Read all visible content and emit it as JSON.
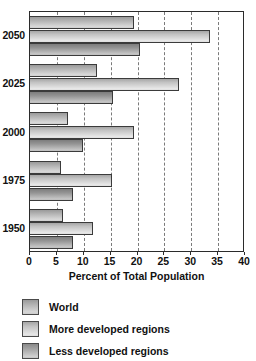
{
  "chart_data": {
    "type": "bar",
    "orientation": "horizontal",
    "title": "",
    "xlabel": "Percent of Total Population",
    "ylabel": "",
    "xlim": [
      0,
      40
    ],
    "xticks": [
      0,
      5,
      10,
      15,
      20,
      25,
      30,
      35,
      40
    ],
    "xtick_labels": [
      "0",
      "5",
      "10",
      "15",
      "20",
      "25",
      "30",
      "35",
      "40"
    ],
    "categories": [
      "1950",
      "1975",
      "2000",
      "2025",
      "2050"
    ],
    "category_order_top_to_bottom": [
      "2050",
      "2025",
      "2000",
      "1975",
      "1950"
    ],
    "grid": true,
    "grid_axis": "x",
    "grid_style": "dashed",
    "legend_position": "below",
    "series": [
      {
        "name": "World",
        "values": [
          6.2,
          5.7,
          7.0,
          12.5,
          19.3
        ]
      },
      {
        "name": "More developed regions",
        "values": [
          11.7,
          15.3,
          19.4,
          27.8,
          33.5
        ]
      },
      {
        "name": "Less developed regions",
        "values": [
          8.0,
          8.0,
          9.9,
          15.5,
          20.5
        ]
      }
    ]
  },
  "axis": {
    "x_title": "Percent of Total Population"
  },
  "legend": {
    "items": [
      {
        "label": "World"
      },
      {
        "label": "More developed regions"
      },
      {
        "label": "Less developed regions"
      }
    ]
  },
  "colors": {
    "series_world": "#b4b4b4",
    "series_more_developed": "#c2c2c2",
    "series_less_developed": "#949494",
    "frame": "#2b2b2b",
    "gridline": "#7a7a7a",
    "text": "#111111",
    "background": "#ffffff"
  }
}
